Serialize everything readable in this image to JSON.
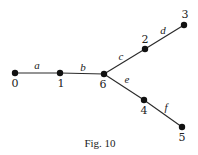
{
  "figure": {
    "caption": "Fig. 10",
    "type": "tree-graph"
  },
  "nodes": [
    {
      "id": "0",
      "label": "0",
      "x": 15,
      "y": 73,
      "label_x": 15,
      "label_y": 87
    },
    {
      "id": "1",
      "label": "1",
      "x": 60,
      "y": 73,
      "label_x": 61,
      "label_y": 87
    },
    {
      "id": "6",
      "label": "6",
      "x": 104,
      "y": 74,
      "label_x": 103,
      "label_y": 88
    },
    {
      "id": "2",
      "label": "2",
      "x": 145,
      "y": 49,
      "label_x": 145,
      "label_y": 43
    },
    {
      "id": "3",
      "label": "3",
      "x": 184,
      "y": 25,
      "label_x": 185,
      "label_y": 18
    },
    {
      "id": "4",
      "label": "4",
      "x": 144,
      "y": 100,
      "label_x": 144,
      "label_y": 114
    },
    {
      "id": "5",
      "label": "5",
      "x": 182,
      "y": 127,
      "label_x": 182,
      "label_y": 141
    }
  ],
  "edges": [
    {
      "id": "a",
      "label": "a",
      "from": "0",
      "to": "1",
      "label_x": 37,
      "label_y": 69
    },
    {
      "id": "b",
      "label": "b",
      "from": "1",
      "to": "6",
      "label_x": 83,
      "label_y": 71
    },
    {
      "id": "c",
      "label": "c",
      "from": "6",
      "to": "2",
      "label_x": 121,
      "label_y": 60
    },
    {
      "id": "d",
      "label": "d",
      "from": "2",
      "to": "3",
      "label_x": 163,
      "label_y": 34
    },
    {
      "id": "e",
      "label": "e",
      "from": "6",
      "to": "4",
      "label_x": 127,
      "label_y": 83
    },
    {
      "id": "f",
      "label": "f",
      "from": "4",
      "to": "5",
      "label_x": 166,
      "label_y": 111
    }
  ]
}
